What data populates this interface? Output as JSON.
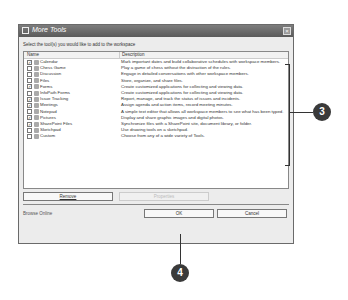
{
  "dialog": {
    "title": "More Tools",
    "close_label": "×",
    "instruction": "Select the tool(s) you would like to add to the workspace",
    "columns": {
      "name": "Name",
      "description": "Description"
    },
    "tools": [
      {
        "name": "Calendar",
        "checked": true,
        "description": "Mark important dates and build collaborative schedules with workspace members."
      },
      {
        "name": "Chess Game",
        "checked": false,
        "description": "Play a game of chess without the distraction of the rules."
      },
      {
        "name": "Discussion",
        "checked": false,
        "description": "Engage in detailed conversations with other workspace members."
      },
      {
        "name": "Files",
        "checked": false,
        "description": "Store, organize, and share files."
      },
      {
        "name": "Forms",
        "checked": true,
        "description": "Create customized applications for collecting and viewing data."
      },
      {
        "name": "InfoPath Forms",
        "checked": false,
        "description": "Create customized applications for collecting and viewing data."
      },
      {
        "name": "Issue Tracking",
        "checked": true,
        "description": "Report, manage, and track the status of issues and incidents."
      },
      {
        "name": "Meetings",
        "checked": true,
        "description": "Assign agenda and action items, record meeting minutes."
      },
      {
        "name": "Notepad",
        "checked": false,
        "description": "A simple text editor that allows all workspace members to see what has been typed."
      },
      {
        "name": "Pictures",
        "checked": true,
        "description": "Display and share graphic images and digital photos."
      },
      {
        "name": "SharePoint Files",
        "checked": true,
        "description": "Synchronize files with a SharePoint site, document library, or folder."
      },
      {
        "name": "Sketchpad",
        "checked": false,
        "description": "Use drawing tools on a sketchpad."
      },
      {
        "name": "Custom",
        "checked": false,
        "description": "Choose from any of a wide variety of Tools."
      }
    ],
    "buttons": {
      "remove": "Remove",
      "properties": "Properties",
      "ok": "OK",
      "cancel": "Cancel"
    },
    "browse_online": "Browse Online"
  },
  "callouts": {
    "three": "3",
    "four": "4"
  },
  "check_mark": "✓"
}
